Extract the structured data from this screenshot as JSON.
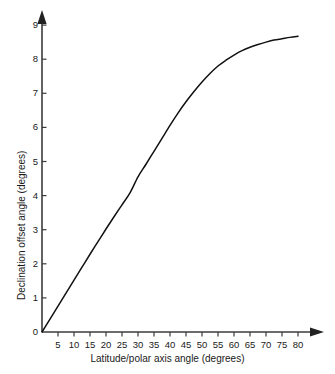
{
  "chart_data": {
    "type": "line",
    "title": "",
    "xlabel": "Latitude/polar axis angle (degrees)",
    "ylabel": "Declination offset angle (degrees)",
    "xlim": [
      0,
      85
    ],
    "ylim": [
      0,
      9.4
    ],
    "grid": false,
    "legend": null,
    "xticks": [
      5,
      10,
      15,
      20,
      25,
      30,
      35,
      40,
      45,
      50,
      55,
      60,
      65,
      70,
      75,
      80
    ],
    "xtick_labels": [
      "5",
      "10",
      "15",
      "20",
      "25",
      "30",
      "35",
      "40",
      "45",
      "50",
      "55",
      "60",
      "65",
      "70",
      "75",
      "80"
    ],
    "yticks": [
      0,
      1,
      2,
      3,
      4,
      5,
      6,
      7,
      8,
      9
    ],
    "ytick_labels": [
      "0",
      "1",
      "2",
      "3",
      "4",
      "5",
      "6",
      "7",
      "8",
      "9"
    ],
    "series": [
      {
        "name": "Declination offset",
        "color": "#111111",
        "x": [
          0,
          2.5,
          5,
          7.5,
          10,
          12.5,
          15,
          17.5,
          20,
          22.5,
          25,
          27.5,
          30,
          32.5,
          35,
          37.5,
          40,
          42.5,
          45,
          47.5,
          50,
          52.5,
          55,
          57.5,
          60,
          62.5,
          65,
          67.5,
          70,
          72.5,
          75,
          77.5,
          80
        ],
        "y": [
          0,
          0.38,
          0.76,
          1.14,
          1.52,
          1.9,
          2.28,
          2.65,
          3.02,
          3.38,
          3.73,
          4.08,
          4.55,
          4.92,
          5.3,
          5.68,
          6.06,
          6.42,
          6.75,
          7.05,
          7.33,
          7.58,
          7.8,
          7.97,
          8.12,
          8.25,
          8.35,
          8.43,
          8.5,
          8.56,
          8.6,
          8.64,
          8.67
        ]
      }
    ],
    "axis_style": {
      "arrow_heads": true,
      "spine_color": "#3b3b3b",
      "tick_direction": "out"
    }
  }
}
